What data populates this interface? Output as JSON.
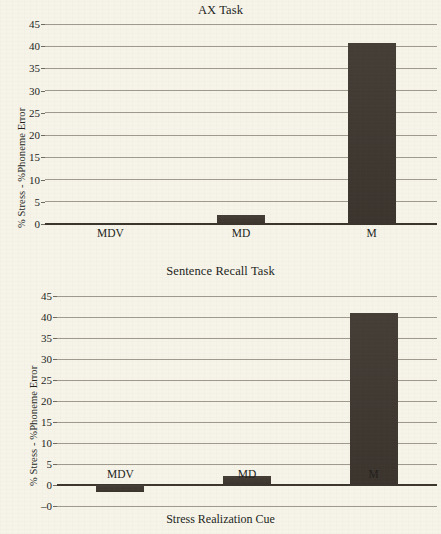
{
  "page": {
    "background_color": "#f6f3e9",
    "bar_color": "#3e3730",
    "axis_color": "#3b352e",
    "grid_color": "#8f897c"
  },
  "xlabel": "Stress Realization Cue",
  "chart_data": [
    {
      "type": "bar",
      "title": "AX Task",
      "xlabel": "",
      "ylabel": "% Stress - %Phoneme Error",
      "categories": [
        "MDV",
        "MD",
        "M"
      ],
      "values": [
        0,
        2.1,
        40.8
      ],
      "yticks": [
        0,
        5,
        10,
        15,
        20,
        25,
        30,
        35,
        40,
        45
      ],
      "ytick_labels": [
        "0",
        "5",
        "10",
        "15",
        "20",
        "25",
        "30",
        "35",
        "40",
        "45"
      ],
      "ylim": [
        0,
        45
      ],
      "grid": true,
      "legend": "none"
    },
    {
      "type": "bar",
      "title": "Sentence Recall Task",
      "xlabel": "Stress Realization Cue",
      "ylabel": "% Stress - %Phoneme Error",
      "categories": [
        "MDV",
        "MD",
        "M"
      ],
      "values": [
        -1.6,
        2.2,
        41.0
      ],
      "yticks": [
        -5,
        0,
        5,
        10,
        15,
        20,
        25,
        30,
        35,
        40,
        45
      ],
      "ytick_labels": [
        "–0",
        "0",
        "5",
        "10",
        "15",
        "20",
        "25",
        "30",
        "35",
        "40",
        "45"
      ],
      "ylim": [
        -5,
        45
      ],
      "grid": true,
      "legend": "none"
    }
  ]
}
